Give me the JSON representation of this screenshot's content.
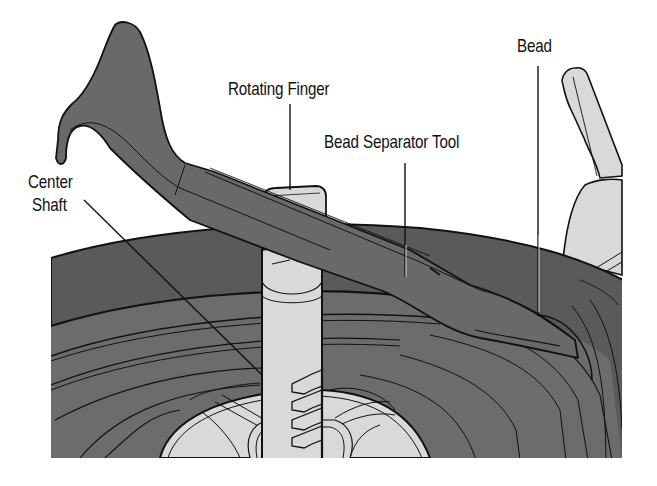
{
  "figure": {
    "background": "#ffffff",
    "colors": {
      "tire_dark": "#585858",
      "tire_mid": "#6c6c6c",
      "tool": "#686868",
      "metal_light": "#d9d9d9",
      "outline": "#111111"
    }
  },
  "labels": {
    "center_shaft": {
      "line1": "Center",
      "line2": "Shaft"
    },
    "rotating_finger": "Rotating Finger",
    "bead_separator_tool": "Bead Separator Tool",
    "bead": "Bead"
  },
  "components": [
    {
      "name": "Center Shaft",
      "callout_target": "vertical shaft in wheel hub"
    },
    {
      "name": "Rotating Finger",
      "callout_target": "block atop the center shaft"
    },
    {
      "name": "Bead Separator Tool",
      "callout_target": "long lever bar"
    },
    {
      "name": "Bead",
      "callout_target": "tire bead at tool tip"
    }
  ]
}
